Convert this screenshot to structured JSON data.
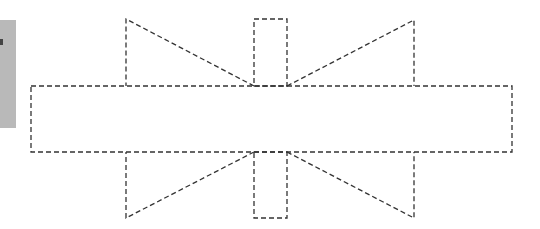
{
  "diagram": {
    "stroke_color": "#333333",
    "side_panel_color": "#b9b9b9",
    "shapes": {
      "main_rect": {
        "x": 31,
        "y": 86,
        "w": 481,
        "h": 66
      },
      "top_tab": {
        "x": 254,
        "y": 19,
        "w": 33,
        "h": 67
      },
      "bottom_tab": {
        "x": 254,
        "y": 152,
        "w": 33,
        "h": 66
      },
      "top_left_triangle": [
        [
          126,
          19
        ],
        [
          126,
          86
        ],
        [
          254,
          86
        ]
      ],
      "top_right_triangle": [
        [
          414,
          20
        ],
        [
          414,
          86
        ],
        [
          287,
          86
        ]
      ],
      "bottom_left_triangle": [
        [
          126,
          152
        ],
        [
          126,
          218
        ],
        [
          254,
          152
        ]
      ],
      "bottom_right_triangle": [
        [
          414,
          152
        ],
        [
          414,
          218
        ],
        [
          287,
          152
        ]
      ]
    }
  }
}
